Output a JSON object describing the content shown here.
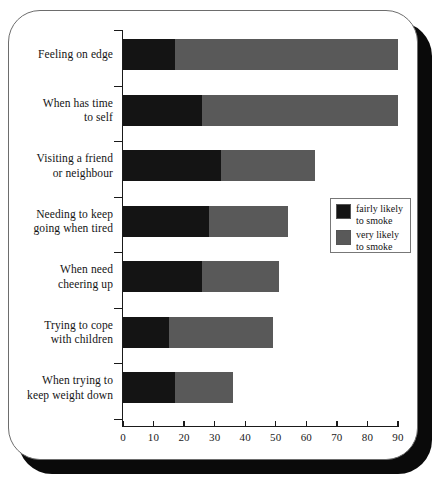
{
  "chart_data": {
    "type": "bar",
    "orientation": "horizontal",
    "stacked": true,
    "title": "",
    "subtitle": "",
    "xlabel": "",
    "ylabel": "",
    "xlim": [
      0,
      90
    ],
    "xticks": [
      0,
      10,
      20,
      30,
      40,
      50,
      60,
      70,
      80,
      90
    ],
    "xtick_labels": [
      "0",
      "10",
      "20",
      "30",
      "40",
      "50",
      "60",
      "70",
      "80",
      "90"
    ],
    "grid": false,
    "legend_position": "center-right",
    "categories": [
      "Feeling on edge",
      "When has time to self",
      "Visiting a friend or neighbour",
      "Needing to keep going when tired",
      "When need cheering up",
      "Trying to cope with children",
      "When trying to keep weight down"
    ],
    "category_lines": [
      [
        "Feeling on edge"
      ],
      [
        "When has time",
        "to self"
      ],
      [
        "Visiting a friend",
        "or neighbour"
      ],
      [
        "Needing to keep",
        "going when tired"
      ],
      [
        "When need",
        "cheering up"
      ],
      [
        "Trying to cope",
        "with children"
      ],
      [
        "When trying to",
        "keep weight down"
      ]
    ],
    "series": [
      {
        "name": "fairly likely to smoke",
        "color": "#141414",
        "values": [
          17,
          26,
          32,
          28,
          26,
          15,
          17
        ]
      },
      {
        "name": "very likely to smoke",
        "color": "#595959",
        "values": [
          73,
          64,
          31,
          26,
          25,
          34,
          19
        ]
      }
    ],
    "totals": [
      90,
      90,
      63,
      54,
      51,
      49,
      36
    ]
  },
  "legend": {
    "items": [
      {
        "swatch": "fairly",
        "line1": "fairly likely",
        "line2": "to smoke"
      },
      {
        "swatch": "very",
        "line1": "very likely",
        "line2": "to smoke"
      }
    ]
  },
  "colors": {
    "fairly_likely": "#141414",
    "very_likely": "#595959",
    "axis": "#1a1a1a",
    "frame_border": "#6d6d6d",
    "shadow": "#0a0a0a",
    "background": "#ffffff"
  }
}
